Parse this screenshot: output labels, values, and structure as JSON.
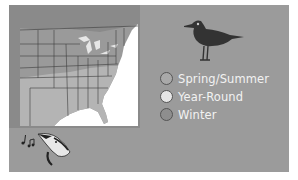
{
  "map": {
    "description": "Range map of eastern United States and southern Canada",
    "colors": {
      "background": "#9b9b9b",
      "map_land_north": "#8f8f8f",
      "map_land_south": "#b5b5b5",
      "ocean": "#ffffff",
      "lakes": "#e8e8e8"
    }
  },
  "legend": {
    "items": [
      {
        "label": "Spring/Summer",
        "color": "#a9a9a9"
      },
      {
        "label": "Year-Round",
        "color": "#e6e6e6"
      },
      {
        "label": "Winter",
        "color": "#8e8e8e"
      }
    ]
  },
  "icons": {
    "bird": "bird-silhouette-icon",
    "song": "singing-bird-icon",
    "notes": "music-notes-icon"
  }
}
